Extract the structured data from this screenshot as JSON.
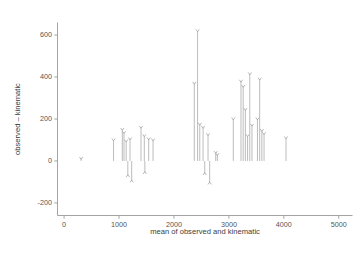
{
  "chart_data": {
    "type": "scatter",
    "title": "",
    "xlabel": "mean of observed and kinematic",
    "ylabel": "observed – kinematic",
    "xlim": [
      -120,
      5250
    ],
    "ylim": [
      -260,
      660
    ],
    "xticks": [
      0,
      1000,
      2000,
      3000,
      4000,
      5000
    ],
    "yticks": [
      -200,
      0,
      200,
      400,
      600
    ],
    "xticklabels": [
      "0",
      "1000",
      "2000",
      "3000",
      "4000",
      "5000"
    ],
    "yticklabels": [
      "-200",
      "0",
      "200",
      "400",
      "600"
    ],
    "grid": false,
    "legend": null,
    "marker_style": "needle-with-caret-head",
    "baseline": 0,
    "series": [
      {
        "name": "observed minus kinematic",
        "points": [
          {
            "x": 310,
            "y": 12
          },
          {
            "x": 900,
            "y": 100
          },
          {
            "x": 1060,
            "y": 150
          },
          {
            "x": 1090,
            "y": 135
          },
          {
            "x": 1130,
            "y": 95
          },
          {
            "x": 1160,
            "y": -70
          },
          {
            "x": 1200,
            "y": 105
          },
          {
            "x": 1230,
            "y": -95
          },
          {
            "x": 1400,
            "y": 160
          },
          {
            "x": 1460,
            "y": 120
          },
          {
            "x": 1470,
            "y": -55
          },
          {
            "x": 1540,
            "y": 105
          },
          {
            "x": 1620,
            "y": 100
          },
          {
            "x": 2370,
            "y": 370
          },
          {
            "x": 2430,
            "y": 620
          },
          {
            "x": 2470,
            "y": 175
          },
          {
            "x": 2530,
            "y": 160
          },
          {
            "x": 2560,
            "y": -60
          },
          {
            "x": 2620,
            "y": 125
          },
          {
            "x": 2650,
            "y": -105
          },
          {
            "x": 2760,
            "y": 40
          },
          {
            "x": 2790,
            "y": 30
          },
          {
            "x": 3080,
            "y": 200
          },
          {
            "x": 3220,
            "y": 380
          },
          {
            "x": 3260,
            "y": 355
          },
          {
            "x": 3300,
            "y": 245
          },
          {
            "x": 3340,
            "y": 120
          },
          {
            "x": 3380,
            "y": 415
          },
          {
            "x": 3420,
            "y": 170
          },
          {
            "x": 3520,
            "y": 200
          },
          {
            "x": 3560,
            "y": 390
          },
          {
            "x": 3600,
            "y": 145
          },
          {
            "x": 3640,
            "y": 130
          },
          {
            "x": 4040,
            "y": 110
          }
        ]
      }
    ]
  },
  "axes": {
    "y_label": "observed – kinematic",
    "x_label": "mean of observed and kinematic"
  }
}
